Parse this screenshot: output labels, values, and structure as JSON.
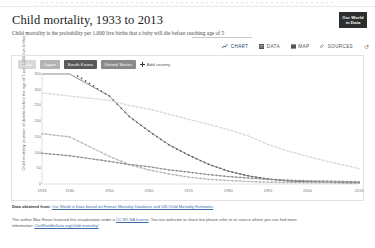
{
  "header": {
    "title": "Child mortality, 1933 to 2013",
    "subtitle": "Child mortality is the probability per 1,000 live births that a baby will die before reaching age of 5",
    "logo_line1": "Our World",
    "logo_line2": "in Data"
  },
  "tabs": [
    {
      "label": "CHART",
      "icon": "line-chart-icon",
      "active": true
    },
    {
      "label": "DATA",
      "icon": "table-icon",
      "active": false
    },
    {
      "label": "MAP",
      "icon": "map-icon",
      "active": false
    },
    {
      "label": "SOURCES",
      "icon": "paperclip-icon",
      "active": false
    }
  ],
  "refresh_icon": "↺",
  "legend": {
    "chips": [
      {
        "label": "India",
        "color": "#d8d8d8",
        "text_color": "#ffffff"
      },
      {
        "label": "Japan",
        "color": "#b3b3b3",
        "text_color": "#ffffff"
      },
      {
        "label": "South Korea",
        "color": "#595959",
        "text_color": "#ffffff"
      },
      {
        "label": "United States",
        "color": "#8a8a8a",
        "text_color": "#ffffff"
      }
    ],
    "add_country_label": "Add country"
  },
  "chart_data": {
    "type": "line",
    "title": "Child mortality, 1933 to 2013",
    "xlabel": "",
    "ylabel": "Child mortality (number of deaths before the age of 5 per 1,000 live births)",
    "xlim": [
      1933,
      2013
    ],
    "ylim": [
      0,
      350
    ],
    "yticks": [
      350,
      300,
      250,
      200,
      150,
      100,
      50,
      0
    ],
    "xticks": [
      1933,
      1940,
      1950,
      1960,
      1970,
      1980,
      1990,
      2000,
      2013
    ],
    "grid": false,
    "legend_position": "top-left-chips",
    "x": [
      1933,
      1940,
      1950,
      1955,
      1960,
      1965,
      1970,
      1975,
      1980,
      1985,
      1990,
      1995,
      2000,
      2005,
      2010,
      2013
    ],
    "series": [
      {
        "name": "South Korea",
        "color": "#595959",
        "values": [
          420,
          360,
          280,
          215,
          168,
          125,
          92,
          63,
          41,
          26,
          16,
          10,
          7,
          6,
          4,
          4
        ]
      },
      {
        "name": "India",
        "color": "#d8d8d8",
        "values": [
          290,
          280,
          266,
          250,
          238,
          222,
          206,
          190,
          173,
          153,
          126,
          105,
          88,
          72,
          58,
          49
        ]
      },
      {
        "name": "Japan",
        "color": "#b3b3b3",
        "values": [
          160,
          150,
          88,
          62,
          45,
          32,
          22,
          15,
          11,
          8,
          6,
          5,
          4,
          4,
          3,
          3
        ]
      },
      {
        "name": "United States",
        "color": "#8a8a8a",
        "values": [
          98,
          90,
          72,
          62,
          55,
          45,
          38,
          30,
          24,
          19,
          15,
          12,
          10,
          9,
          8,
          7
        ]
      }
    ]
  },
  "footer": {
    "source_label": "Data obtained from:",
    "source_text": "Our World in Data based on Human Mortality Database and UN Child Mortality Estimates",
    "license_part1": "The author Max Roser licensed this visualization under a",
    "license_link": "CC BY-SA license",
    "license_part2": ". You are welcome to share but please refer to its source where you can find more",
    "license_part3": "information:",
    "license_url": "OurWorldInData.org/child-mortality/"
  }
}
